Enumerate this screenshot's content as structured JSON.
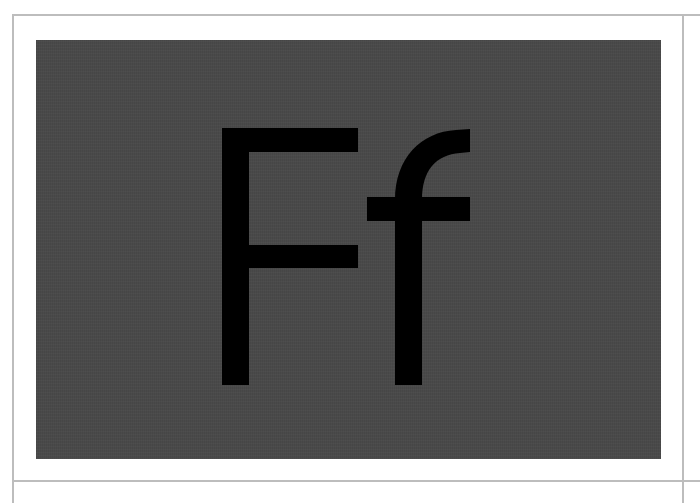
{
  "card": {
    "glyph_text": "Ff",
    "background_color": "#4a4a4a",
    "glyph_color": "#000000",
    "frame_color": "#bdbdbd"
  }
}
